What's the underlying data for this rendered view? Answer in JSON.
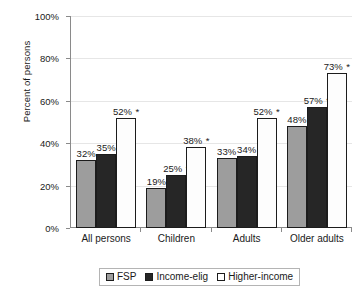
{
  "chart_data": {
    "type": "bar",
    "title": "",
    "xlabel": "",
    "ylabel": "Percent of persons",
    "ylim": [
      0,
      100
    ],
    "ytick_labels": [
      "0%",
      "20%",
      "40%",
      "60%",
      "80%",
      "100%"
    ],
    "ytick_values": [
      0,
      20,
      40,
      60,
      80,
      100
    ],
    "grid": true,
    "legend_position": "bottom",
    "categories": [
      "All persons",
      "Children",
      "Adults",
      "Older adults"
    ],
    "series": [
      {
        "name": "FSP",
        "color": "#9d9d9d",
        "values": [
          32,
          19,
          33,
          48
        ],
        "labels": [
          "32%",
          "19%",
          "33%",
          "48%"
        ],
        "significant": [
          false,
          false,
          false,
          false
        ]
      },
      {
        "name": "Income-elig",
        "color": "#262626",
        "values": [
          35,
          25,
          34,
          57
        ],
        "labels": [
          "35%",
          "25%",
          "34%",
          "57%"
        ],
        "significant": [
          false,
          true,
          false,
          true
        ]
      },
      {
        "name": "Higher-income",
        "color": "#ffffff",
        "values": [
          52,
          38,
          52,
          73
        ],
        "labels": [
          "52%",
          "38%",
          "52%",
          "73%"
        ],
        "significant": [
          true,
          true,
          true,
          true
        ]
      }
    ],
    "significance_marker": "*"
  }
}
